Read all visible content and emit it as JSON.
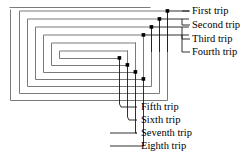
{
  "figure": {
    "type": "spiral-trip-diagram",
    "stroke_color": "#7a7a7a",
    "leader_color": "#1a1a1a",
    "marker_color": "#000000",
    "background_color": "#ffffff",
    "text_color": "#000000"
  },
  "labels": {
    "right": [
      {
        "id": "first",
        "text": "First trip",
        "x": 192,
        "y": 6
      },
      {
        "id": "second",
        "text": "Second trip",
        "x": 192,
        "y": 19
      },
      {
        "id": "third",
        "text": "Third trip",
        "x": 192,
        "y": 33
      },
      {
        "id": "fourth",
        "text": "Fourth trip",
        "x": 192,
        "y": 47
      }
    ],
    "bottom": [
      {
        "id": "fifth",
        "text": "Fifth trip",
        "x": 122,
        "y": 102
      },
      {
        "id": "sixth",
        "text": "Sixth trip",
        "x": 122,
        "y": 115
      },
      {
        "id": "seventh",
        "text": "Seventh trip",
        "x": 122,
        "y": 128
      },
      {
        "id": "eighth",
        "text": "Eighth trip",
        "x": 122,
        "y": 141
      }
    ]
  },
  "geometry": {
    "spiral_path": "M 150 8 L 10 8 M 11 10 L 11 100 L 167 100 L 167 11 L 20 11 L 20 93 L 159 93 L 159 19 L 28 19 L 28 86 L 151 86 L 151 27 L 36 27 L 36 79 L 143 79 L 143 35 L 44 35 L 44 72 L 135 72 L 135 43 L 52 43 L 52 65 L 127 65 L 127 51 L 60 51 L 60 58 L 119 58",
    "leaders_right": [
      {
        "id": "first",
        "marker": [
          167,
          11
        ],
        "path": "M 167 11 L 189 11"
      },
      {
        "id": "second",
        "marker": [
          159,
          19
        ],
        "path": "M 159 19 L 189 19 M 189 11 L 189 25 M 189 25 L 189 25"
      },
      {
        "id": "third",
        "marker": [
          151,
          27
        ],
        "path": "M 151 27 L 189 27"
      },
      {
        "id": "fourth",
        "marker": [
          143,
          35
        ],
        "path": "M 143 35 L 189 35"
      }
    ],
    "leaders_bottom": [
      {
        "id": "fifth",
        "marker": [
          119,
          58
        ],
        "path": "M 119 58 L 119 107 L 137 107"
      },
      {
        "id": "sixth",
        "marker": [
          127,
          65
        ],
        "path": "M 127 65 L 127 120 L 137 120"
      },
      {
        "id": "seventh",
        "marker": [
          135,
          72
        ],
        "path": "M 135 72 L 135 133 L 137 133"
      },
      {
        "id": "eighth",
        "marker": [
          143,
          79
        ],
        "path": "M 143 79 L 143 146 L 137 146"
      }
    ]
  }
}
